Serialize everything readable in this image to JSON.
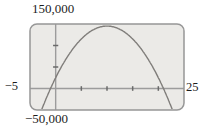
{
  "figure": {
    "top_label": "150,000",
    "bottom_label": "−50,000",
    "left_label": "−5",
    "right_label": "25"
  },
  "colors": {
    "screen_fill": "#ebeae7",
    "screen_border": "#979797",
    "axis": "#9c9c9c",
    "tick": "#6a6a6a",
    "curve": "#807e7b",
    "text": "#1c1c1c"
  },
  "chart_data": {
    "type": "line",
    "title": "",
    "x_window": [
      -5,
      25
    ],
    "y_window": [
      -50000,
      150000
    ],
    "xscl": 5,
    "yscl": 50000,
    "grid": false,
    "legend": false,
    "axis_labels": {
      "top": "150,000",
      "bottom": "−50,000",
      "left": "−5",
      "right": "25"
    },
    "curve": {
      "model": "y = a*(x - r1)*(x - r2)",
      "a": -1200,
      "r1": -1,
      "r2": 21,
      "vertex_approx": [
        10,
        145200
      ]
    },
    "sample_points": [
      [
        -1,
        0
      ],
      [
        0,
        25200
      ],
      [
        5,
        115200
      ],
      [
        10,
        145200
      ],
      [
        15,
        115200
      ],
      [
        20,
        25200
      ],
      [
        21,
        0
      ]
    ]
  }
}
